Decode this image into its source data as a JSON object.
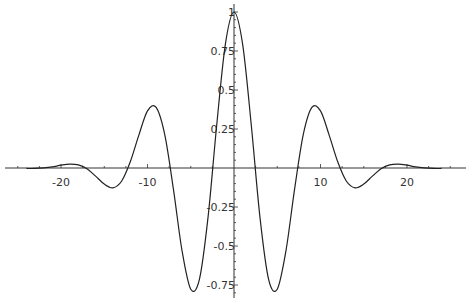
{
  "chart_data": {
    "type": "line",
    "title": "",
    "xlabel": "",
    "ylabel": "",
    "xlim": [
      -27,
      27
    ],
    "ylim": [
      -0.8,
      1.0
    ],
    "grid": false,
    "legend": null,
    "x_ticks": [
      -20,
      -10,
      10,
      20
    ],
    "x_tick_labels": [
      "-20",
      "-10",
      "10",
      "20"
    ],
    "y_ticks": [
      -0.75,
      -0.5,
      -0.25,
      0.25,
      0.5,
      0.75,
      1
    ],
    "y_tick_labels": [
      "-0.75",
      "-0.5",
      "-0.25",
      "0.25",
      "0.5",
      "0.75",
      "1"
    ],
    "series": [
      {
        "name": "f(x)",
        "x": [
          -24,
          -23,
          -22,
          -21,
          -20,
          -19,
          -18,
          -17,
          -16,
          -15,
          -14,
          -13,
          -12,
          -11,
          -10,
          -9,
          -8,
          -7,
          -6,
          -5,
          -4,
          -3,
          -2,
          -1,
          0,
          1,
          2,
          3,
          4,
          5,
          6,
          7,
          8,
          9,
          10,
          11,
          12,
          13,
          14,
          15,
          16,
          17,
          18,
          19,
          20,
          21,
          22,
          23,
          24
        ],
        "values": [
          -0.003,
          -0.003,
          0.0003,
          0.007,
          0.018,
          0.025,
          0.02,
          -0.005,
          -0.052,
          -0.103,
          -0.127,
          -0.085,
          0.038,
          0.211,
          0.366,
          0.388,
          0.212,
          -0.137,
          -0.533,
          -0.777,
          -0.714,
          -0.315,
          0.274,
          0.793,
          1.0,
          0.793,
          0.274,
          -0.315,
          -0.714,
          -0.777,
          -0.533,
          -0.137,
          0.212,
          0.388,
          0.366,
          0.211,
          0.038,
          -0.085,
          -0.127,
          -0.103,
          -0.052,
          -0.005,
          0.02,
          0.025,
          0.018,
          0.007,
          0.0003,
          -0.003,
          -0.003
        ]
      }
    ]
  },
  "colors": {
    "axis": "#333333",
    "curve": "#222222",
    "background": "#ffffff"
  }
}
